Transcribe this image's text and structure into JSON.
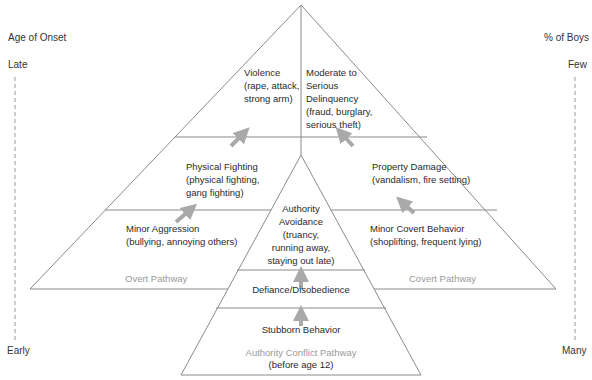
{
  "axes": {
    "left": {
      "title": "Age of Onset",
      "top": "Late",
      "bottom": "Early"
    },
    "right": {
      "title": "% of Boys",
      "top": "Few",
      "bottom": "Many"
    }
  },
  "overt": {
    "pathway_label": "Overt Pathway",
    "levels": [
      {
        "line1": "Violence",
        "line2": "(rape, attack,",
        "line3": "strong arm)"
      },
      {
        "line1": "Physical Fighting",
        "line2": "(physical fighting,",
        "line3": "gang fighting)"
      },
      {
        "line1": "Minor Aggression",
        "line2": "(bullying, annoying others)"
      }
    ]
  },
  "covert": {
    "pathway_label": "Covert Pathway",
    "levels": [
      {
        "line1": "Moderate to",
        "line2": "Serious",
        "line3": "Delinquency",
        "line4": "(fraud, burglary,",
        "line5": "serious theft)"
      },
      {
        "line1": "Property Damage",
        "line2": "(vandalism, fire setting)"
      },
      {
        "line1": "Minor Covert Behavior",
        "line2": "(shoplifting, frequent lying)"
      }
    ]
  },
  "authority": {
    "pathway_label": "Authority Conflict Pathway",
    "pathway_note": "(before age 12)",
    "levels": [
      {
        "line1": "Authority",
        "line2": "Avoidance",
        "line3": "(truancy,",
        "line4": "running away,",
        "line5": "staying out late)"
      },
      {
        "line1": "Defiance/Disobedience"
      },
      {
        "line1": "Stubborn Behavior"
      }
    ]
  },
  "colors": {
    "line": "#8a8a8a",
    "arrow": "#a9a9a9",
    "pathway_text": "#9a9a9a"
  }
}
